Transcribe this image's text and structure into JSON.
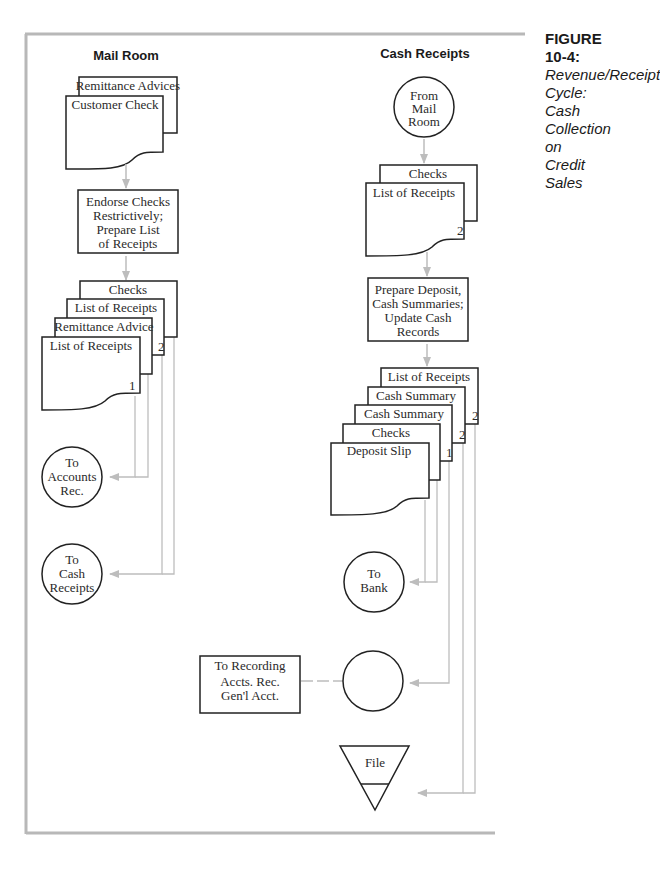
{
  "figure": {
    "label": "FIGURE  10-4:",
    "caption_lines": [
      "Revenue/Receipt",
      "Cycle: Cash",
      "Collection on",
      "Credit Sales"
    ]
  },
  "columns": {
    "mail_room": "Mail Room",
    "cash_receipts": "Cash Receipts"
  },
  "mail_room": {
    "input_docs": [
      "Remittance Advices",
      "Customer Check"
    ],
    "process": [
      "Endorse Checks",
      "Restrictively;",
      "Prepare List",
      "of Receipts"
    ],
    "output_docs": [
      {
        "label": "Checks",
        "copy": ""
      },
      {
        "label": "List of Receipts",
        "copy": "2"
      },
      {
        "label": "Remittance Advice",
        "copy": ""
      },
      {
        "label": "List of Receipts",
        "copy": "1"
      }
    ],
    "connectors": [
      {
        "lines": [
          "To",
          "Accounts",
          "Rec."
        ]
      },
      {
        "lines": [
          "To",
          "Cash",
          "Receipts"
        ]
      }
    ]
  },
  "cash_receipts": {
    "from_connector": [
      "From",
      "Mail",
      "Room"
    ],
    "input_docs": [
      {
        "label": "Checks",
        "copy": ""
      },
      {
        "label": "List of Receipts",
        "copy": "2"
      }
    ],
    "process": [
      "Prepare Deposit,",
      "Cash Summaries;",
      "Update Cash",
      "Records"
    ],
    "output_docs": [
      {
        "label": "List of Receipts",
        "copy": "2"
      },
      {
        "label": "Cash Summary",
        "copy": "2"
      },
      {
        "label": "Cash Summary",
        "copy": "1"
      },
      {
        "label": "Checks",
        "copy": ""
      },
      {
        "label": "Deposit Slip",
        "copy": ""
      }
    ],
    "bank_connector": [
      "To",
      "Bank"
    ],
    "annotation": [
      "To Recording",
      "Accts. Rec.",
      "Gen'l Acct."
    ],
    "file_label": "File"
  },
  "colors": {
    "frame": "#b8b8b8",
    "flow_line": "#bdbdbd",
    "shape_stroke": "#222222"
  }
}
